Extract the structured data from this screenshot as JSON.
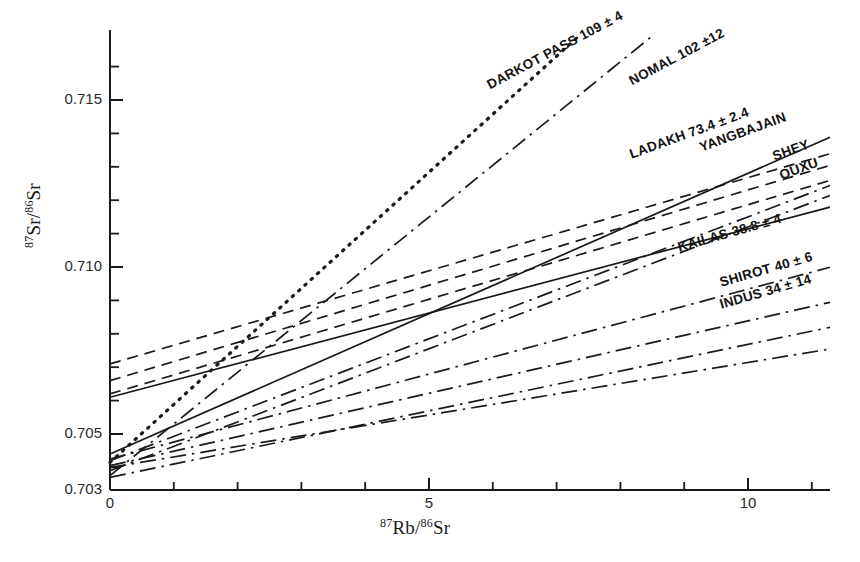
{
  "figure": {
    "kind": "rb-sr-isochron-diagram",
    "background": "#ffffff",
    "ink": "#1a1a1a"
  },
  "axes": {
    "ylabel_html": "<sup>87</sup>Sr/<sup>86</sup>Sr",
    "xlabel_html": "<sup>87</sup>Rb/<sup>86</sup>Sr",
    "y_ticks": [
      "0.715",
      "0.710",
      "0.705",
      "0.703"
    ],
    "x_ticks": [
      "0",
      "5",
      "10"
    ],
    "xlim": [
      0,
      11.3
    ],
    "ylim": [
      0.703,
      0.7168
    ],
    "y_minor_step": 0.001,
    "x_minor_step": 1
  },
  "chart_data": {
    "type": "line",
    "title": "",
    "xlabel": "87Rb/86Sr",
    "ylabel": "87Sr/86Sr",
    "xlim": [
      0,
      11.3
    ],
    "ylim": [
      0.703,
      0.7168
    ],
    "grid": false,
    "legend": "inline-annotations",
    "xticks": [
      0,
      5,
      10
    ],
    "yticks": [
      0.703,
      0.705,
      0.71,
      0.715
    ],
    "note": "Isochron regression lines; label text gives locality, age in Ma and uncertainty.",
    "series": [
      {
        "name": "DARKOT PASS",
        "label": "DARKOT PASS 109 ± 4",
        "age_ma": 109,
        "age_error": 4,
        "style": "dotted",
        "intercept": 0.70415,
        "x_end": 7.35,
        "y_end": 0.71692
      },
      {
        "name": "NOMAL",
        "label": "NOMAL 102 ±12",
        "age_ma": 102,
        "age_error": 12,
        "style": "dashdot",
        "intercept": 0.70375,
        "x_end": 8.5,
        "y_end": 0.71692
      },
      {
        "name": "LADAKH",
        "label": "LADAKH 73.4 ± 2.4",
        "age_ma": 73.4,
        "age_error": 2.4,
        "style": "solid",
        "intercept": 0.7044,
        "x_end": 11.3,
        "y_end": 0.7139
      },
      {
        "name": "LADAKH-UPPER",
        "label": "",
        "age_ma": 73.4,
        "age_error": 2.4,
        "style": "dashed",
        "intercept": 0.7071,
        "x_end": 11.3,
        "y_end": 0.7134
      },
      {
        "name": "YANGBAJAIN",
        "label": "YANGBAJAIN",
        "age_ma": null,
        "age_error": null,
        "style": "dashed",
        "intercept": 0.7066,
        "x_end": 11.3,
        "y_end": 0.71305
      },
      {
        "name": "SHEY",
        "label": "SHEY",
        "age_ma": null,
        "age_error": null,
        "style": "dashed",
        "intercept": 0.7062,
        "x_end": 11.3,
        "y_end": 0.7126
      },
      {
        "name": "OUXU",
        "label": "OUXU",
        "age_ma": null,
        "age_error": null,
        "style": "dashdot",
        "intercept": 0.7042,
        "x_end": 11.3,
        "y_end": 0.71245
      },
      {
        "name": "LADAKH-LOWER",
        "label": "",
        "age_ma": null,
        "age_error": null,
        "style": "solid",
        "intercept": 0.7061,
        "x_end": 11.3,
        "y_end": 0.7118
      },
      {
        "name": "KAILAS",
        "label": "KAILAS 38.8 ± 4",
        "age_ma": 38.8,
        "age_error": 4,
        "style": "dashdot",
        "intercept": 0.7039,
        "x_end": 11.3,
        "y_end": 0.71215
      },
      {
        "name": "SHIROT",
        "label": "SHIROT 40 ± 6",
        "age_ma": 40,
        "age_error": 6,
        "style": "dashdot",
        "intercept": 0.70425,
        "x_end": 11.3,
        "y_end": 0.71
      },
      {
        "name": "INDUS",
        "label": "INDUS 34 ± 14",
        "age_ma": 34,
        "age_error": 14,
        "style": "dashdot",
        "intercept": 0.70405,
        "x_end": 11.3,
        "y_end": 0.70895
      },
      {
        "name": "AUX-A",
        "label": "",
        "age_ma": null,
        "age_error": null,
        "style": "dashdot",
        "intercept": 0.7037,
        "x_end": 11.3,
        "y_end": 0.7082
      },
      {
        "name": "AUX-B",
        "label": "",
        "age_ma": null,
        "age_error": null,
        "style": "dashdot",
        "intercept": 0.704,
        "x_end": 11.3,
        "y_end": 0.70755
      }
    ]
  },
  "annotations": [
    {
      "id": "darkot-pass",
      "text": "DARKOT PASS 109 ± 4",
      "x": 488,
      "y": 78,
      "rotate": -28
    },
    {
      "id": "nomal",
      "text": "NOMAL 102 ±12",
      "x": 630,
      "y": 74,
      "rotate": -28
    },
    {
      "id": "ladakh",
      "text": "LADAKH  73.4 ± 2.4",
      "x": 630,
      "y": 147,
      "rotate": -20
    },
    {
      "id": "yangbajain",
      "text": "YANGBAJAIN",
      "x": 700,
      "y": 140,
      "rotate": -20
    },
    {
      "id": "shey",
      "text": "SHEY",
      "x": 773,
      "y": 149,
      "rotate": -20
    },
    {
      "id": "ouxu",
      "text": "OUXU",
      "x": 780,
      "y": 168,
      "rotate": -20
    },
    {
      "id": "kailas",
      "text": "KAILAS   38.8 ± 4",
      "x": 678,
      "y": 240,
      "rotate": -16
    },
    {
      "id": "shirot",
      "text": "SHIROT 40 ± 6",
      "x": 720,
      "y": 275,
      "rotate": -16
    },
    {
      "id": "indus",
      "text": "INDUS 34 ± 14",
      "x": 720,
      "y": 297,
      "rotate": -16
    }
  ]
}
